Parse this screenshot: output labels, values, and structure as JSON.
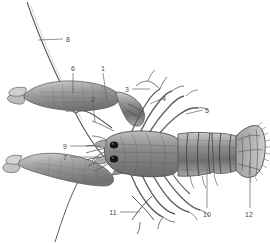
{
  "figure": {
    "style": "grayscale pencil / halftone scientific illustration",
    "background_color": "#ffffff",
    "ink_color": "#4a4a4a",
    "body_fill": "#9a9a9a",
    "body_shadow": "#6a6a6a",
    "eye_color": "#1a1a1a"
  },
  "labels": [
    {
      "id": "1",
      "text": "1",
      "x": 101,
      "y": 68,
      "leader": "vertical",
      "target_x": 108,
      "target_y": 101
    },
    {
      "id": "2",
      "text": "2",
      "x": 92,
      "y": 99,
      "leader": "vertical",
      "target_x": 94,
      "target_y": 122
    },
    {
      "id": "3",
      "text": "3",
      "x": 127,
      "y": 89,
      "leader": "horizontal",
      "target_x": 147,
      "target_y": 89
    },
    {
      "id": "4",
      "text": "4",
      "x": 163,
      "y": 99,
      "leader": "horizontal",
      "target_x": 152,
      "target_y": 104
    },
    {
      "id": "5",
      "text": "5",
      "x": 205,
      "y": 110,
      "leader": "horizontal",
      "target_x": 186,
      "target_y": 113
    },
    {
      "id": "6",
      "text": "6",
      "x": 73,
      "y": 68,
      "leader": "vertical",
      "target_x": 73,
      "target_y": 93
    },
    {
      "id": "7",
      "text": "7",
      "x": 65,
      "y": 157,
      "leader": "horizontal",
      "target_x": 100,
      "target_y": 157
    },
    {
      "id": "8",
      "text": "8",
      "x": 68,
      "y": 39,
      "leader": "horizontal",
      "target_x": 38,
      "target_y": 40
    },
    {
      "id": "9",
      "text": "9",
      "x": 65,
      "y": 146,
      "leader": "horizontal",
      "target_x": 100,
      "target_y": 146
    },
    {
      "id": "10",
      "text": "10",
      "x": 205,
      "y": 214,
      "leader": "vertical",
      "target_x": 207,
      "target_y": 165
    },
    {
      "id": "11",
      "text": "11",
      "x": 113,
      "y": 213,
      "leader": "horizontal",
      "target_x": 138,
      "target_y": 212
    },
    {
      "id": "12",
      "text": "12",
      "x": 248,
      "y": 214,
      "leader": "vertical",
      "target_x": 250,
      "target_y": 160
    }
  ],
  "parts": {
    "antenna_long": "long-antenna",
    "cheliped_upper": "upper-claw",
    "cheliped_lower": "lower-claw",
    "carapace": "carapace",
    "abdomen": "segmented-abdomen",
    "telson": "tail-fan",
    "eyes": "compound-eyes",
    "walking_legs": "walking-legs",
    "antennules": "antennules"
  }
}
